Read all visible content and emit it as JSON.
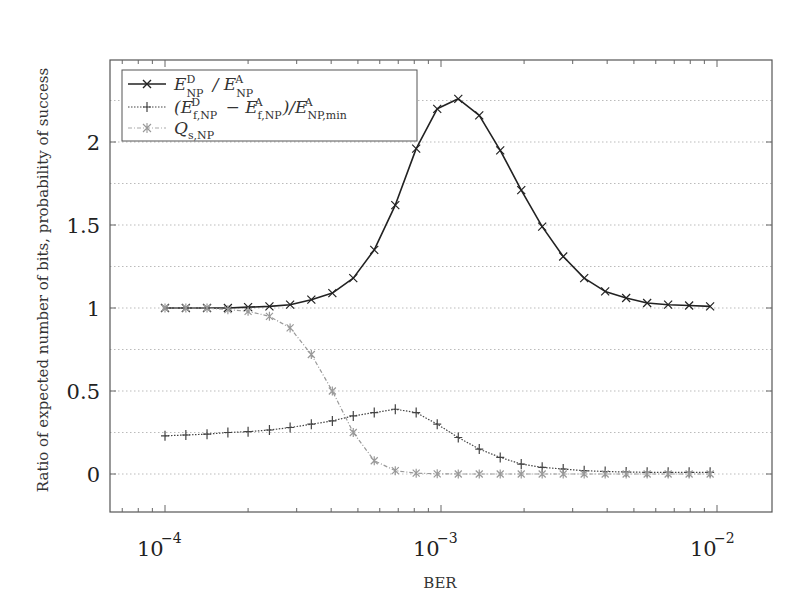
{
  "chart_data": {
    "type": "line",
    "title": "",
    "xlabel": "BER",
    "ylabel": "Ratio of expected number of bits, probability of success",
    "xscale": "log",
    "xlim": [
      7e-05,
      0.022
    ],
    "ylim": [
      -0.22,
      2.48
    ],
    "xticks": [
      {
        "value": 0.0001,
        "label": "10^-4"
      },
      {
        "value": 0.001,
        "label": "10^-3"
      },
      {
        "value": 0.01,
        "label": "10^-2"
      }
    ],
    "yticks": [
      {
        "value": 0,
        "label": "0"
      },
      {
        "value": 0.5,
        "label": "0.5"
      },
      {
        "value": 1,
        "label": "1"
      },
      {
        "value": 1.5,
        "label": "1.5"
      },
      {
        "value": 2,
        "label": "2"
      }
    ],
    "grid": "dotted, y every 0.25",
    "legend_position": "upper left",
    "x": [
      0.0001,
      0.000119,
      0.000142,
      0.000169,
      0.0002,
      0.000239,
      0.000284,
      0.000339,
      0.000404,
      0.000481,
      0.000573,
      0.000683,
      0.000813,
      0.000969,
      0.001155,
      0.001376,
      0.001639,
      0.001953,
      0.002326,
      0.002772,
      0.003302,
      0.003934,
      0.004687,
      0.005584,
      0.006653,
      0.007926,
      0.009443
    ],
    "series": [
      {
        "name": "E_NP^D / E_NP^A",
        "marker": "x",
        "line": "solid",
        "color": "#222222",
        "values": [
          1.0,
          1.0,
          1.0,
          1.0,
          1.005,
          1.01,
          1.02,
          1.05,
          1.09,
          1.18,
          1.35,
          1.62,
          1.96,
          2.2,
          2.26,
          2.16,
          1.95,
          1.71,
          1.49,
          1.31,
          1.18,
          1.1,
          1.06,
          1.03,
          1.02,
          1.015,
          1.01
        ]
      },
      {
        "name": "(E_f,NP^D - E_f,NP^A) / E_NP,min^A",
        "marker": "+",
        "line": "dotted",
        "color": "#444444",
        "values": [
          0.23,
          0.235,
          0.24,
          0.25,
          0.255,
          0.265,
          0.28,
          0.3,
          0.32,
          0.35,
          0.37,
          0.39,
          0.37,
          0.3,
          0.22,
          0.15,
          0.1,
          0.06,
          0.04,
          0.03,
          0.02,
          0.015,
          0.012,
          0.01,
          0.01,
          0.01,
          0.01
        ]
      },
      {
        "name": "Q_s,NP",
        "marker": "asterisk",
        "line": "dashdot",
        "color": "#999999",
        "values": [
          1.0,
          1.0,
          1.0,
          0.99,
          0.98,
          0.95,
          0.88,
          0.72,
          0.5,
          0.25,
          0.08,
          0.02,
          0.005,
          0.001,
          0.0,
          0.0,
          0.0,
          0.0,
          0.0,
          0.0,
          0.0,
          0.0,
          0.0,
          0.0,
          0.0,
          0.0,
          0.0
        ]
      }
    ]
  },
  "legend": {
    "items": [
      {
        "label_main": "E",
        "label_sup": "D",
        "label_sub": "NP",
        "tail": " / E",
        "tail_sup": "A",
        "tail_sub": "NP"
      },
      {
        "label": "(E f,NP D − E f,NP A) / E NP,min A"
      },
      {
        "label": "Q s,NP"
      }
    ]
  },
  "axes": {
    "xlabel": "BER",
    "ylabel": "Ratio of expected number of bits, probability of success",
    "ytick_labels": [
      "0",
      "0.5",
      "1",
      "1.5",
      "2"
    ],
    "xtick_base": "10",
    "xtick_exps": [
      "−4",
      "−3",
      "−2"
    ]
  }
}
